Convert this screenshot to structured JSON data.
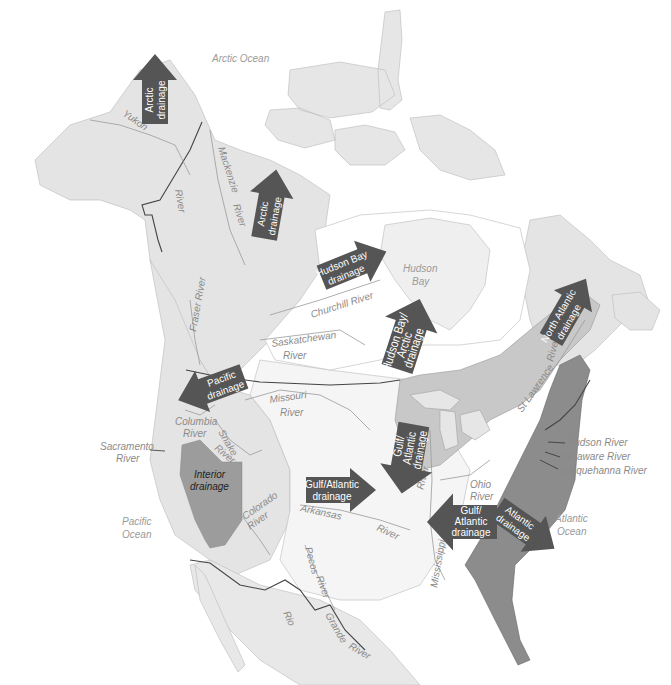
{
  "colors": {
    "background": "#ffffff",
    "land_light": "#e4e4e4",
    "land_lighter": "#eeeeee",
    "hudson_basin": "#ffffff",
    "great_lakes_zone": "#c8c8c8",
    "atlantic_zone": "#8c8c8c",
    "interior_zone": "#9c9c9c",
    "arrow_fill": "#555555",
    "arrow_text": "#ffffff",
    "border_line": "#444444",
    "river_line": "#9a9a9a",
    "label_text": "#8a8a8a"
  },
  "oceans": {
    "arctic": "Arctic Ocean",
    "hudson_bay_1": "Hudson",
    "hudson_bay_2": "Bay",
    "pacific_1": "Pacific",
    "pacific_2": "Ocean",
    "atlantic_1": "Atlantic",
    "atlantic_2": "Ocean"
  },
  "rivers": {
    "yukon": "Yukon",
    "river_nw": "River",
    "mackenzie_1": "Mackenzie",
    "mackenzie_2": "River",
    "fraser": "Fraser River",
    "churchill": "Churchill River",
    "saskatchewan_1": "Saskatchewan",
    "saskatchewan_2": "River",
    "missouri_1": "Missouri",
    "missouri_2": "River",
    "columbia_1": "Columbia",
    "columbia_2": "River",
    "snake_1": "Snake",
    "snake_2": "River",
    "sacramento_1": "Sacramento",
    "sacramento_2": "River",
    "colorado_1": "Colorado",
    "colorado_2": "River",
    "arkansas_1": "Arkansas",
    "arkansas_2": "River",
    "pecos_1": "Pecos",
    "pecos_2": "River",
    "rio_grande_1": "Rio",
    "rio_grande_2": "Grande",
    "rio_grande_3": "River",
    "mississippi": "Mississippi",
    "ohio_1": "Ohio",
    "ohio_2": "River",
    "upper_miss": "River",
    "st_lawrence_1": "St Lawrence",
    "st_lawrence_2": "River",
    "hudson": "Hudson River",
    "delaware": "Delaware River",
    "susquehanna": "Susquehanna River"
  },
  "drainage_arrows": [
    {
      "id": "arctic-alaska",
      "line1": "Arctic",
      "line2": "drainage",
      "direction": "north"
    },
    {
      "id": "arctic-mackenzie",
      "line1": "Arctic",
      "line2": "drainage",
      "direction": "north"
    },
    {
      "id": "hudson-bay",
      "line1": "Hudson Bay",
      "line2": "drainage",
      "direction": "northeast"
    },
    {
      "id": "hudson-bay-arctic",
      "line1": "Hudson Bay/",
      "line2": "Arctic",
      "line3": "drainage",
      "direction": "north"
    },
    {
      "id": "north-atlantic",
      "line1": "North Atlantic",
      "line2": "drainage",
      "direction": "northeast"
    },
    {
      "id": "pacific",
      "line1": "Pacific",
      "line2": "drainage",
      "direction": "west"
    },
    {
      "id": "gulf-atlantic-west",
      "line1": "Gulf/Atlantic",
      "line2": "drainage",
      "direction": "east"
    },
    {
      "id": "gulf-atlantic-north",
      "line1": "Gulf/",
      "line2": "Atlantic",
      "line3": "drainage",
      "direction": "south"
    },
    {
      "id": "gulf-atlantic-south",
      "line1": "Gulf/",
      "line2": "Atlantic",
      "line3": "drainage",
      "direction": "west"
    },
    {
      "id": "atlantic",
      "line1": "Atlantic",
      "line2": "drainage",
      "direction": "southeast"
    }
  ],
  "interior": {
    "line1": "Interior",
    "line2": "drainage"
  }
}
